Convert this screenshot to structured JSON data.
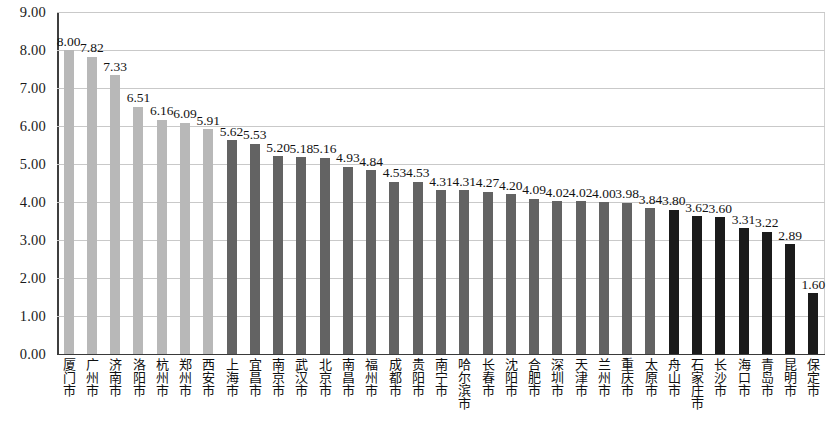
{
  "chart_data": {
    "type": "bar",
    "title": "",
    "subtitle": "",
    "xlabel": "",
    "ylabel": "",
    "ylim": [
      0.0,
      9.0
    ],
    "y_tick_step": 1.0,
    "grid": true,
    "legend": "none",
    "legend_position": "none",
    "y_ticks": [
      "0.00",
      "1.00",
      "2.00",
      "3.00",
      "4.00",
      "5.00",
      "6.00",
      "7.00",
      "8.00",
      "9.00"
    ],
    "categories": [
      "厦门市",
      "广州市",
      "济南市",
      "洛阳市",
      "杭州市",
      "郑州市",
      "西安市",
      "上海市",
      "宜昌市",
      "南京市",
      "武汉市",
      "北京市",
      "南昌市",
      "福州市",
      "成都市",
      "贵阳市",
      "南宁市",
      "哈尔滨市",
      "长春市",
      "沈阳市",
      "合肥市",
      "深圳市",
      "天津市",
      "兰州市",
      "重庆市",
      "太原市",
      "舟山市",
      "石家庄市",
      "长沙市",
      "海口市",
      "青岛市",
      "昆明市",
      "保定市"
    ],
    "values": [
      8.0,
      7.82,
      7.33,
      6.51,
      6.16,
      6.09,
      5.91,
      5.62,
      5.53,
      5.2,
      5.18,
      5.16,
      4.93,
      4.84,
      4.53,
      4.53,
      4.31,
      4.31,
      4.27,
      4.2,
      4.09,
      4.02,
      4.02,
      4.0,
      3.98,
      3.84,
      3.8,
      3.62,
      3.6,
      3.31,
      3.22,
      2.89,
      1.6
    ],
    "value_labels": [
      "8.00",
      "7.82",
      "7.33",
      "6.51",
      "6.16",
      "6.09",
      "5.91",
      "5.62",
      "5.53",
      "5.20",
      "5.18",
      "5.16",
      "4.93",
      "4.84",
      "4.53",
      "4.53",
      "4.31",
      "4.31",
      "4.27",
      "4.20",
      "4.09",
      "4.02",
      "4.02",
      "4.00",
      "3.98",
      "3.84",
      "3.80",
      "3.62",
      "3.60",
      "3.31",
      "3.22",
      "2.89",
      "1.60"
    ],
    "tones": [
      "light",
      "light",
      "light",
      "light",
      "light",
      "light",
      "light",
      "mid",
      "mid",
      "mid",
      "mid",
      "mid",
      "mid",
      "mid",
      "mid",
      "mid",
      "mid",
      "mid",
      "mid",
      "mid",
      "mid",
      "mid",
      "mid",
      "mid",
      "mid",
      "mid",
      "dark",
      "dark",
      "dark",
      "dark",
      "dark",
      "dark",
      "dark"
    ],
    "colors": {
      "tone_light": "#b8b8b8",
      "tone_mid": "#636363",
      "tone_dark": "#1b1b1b",
      "gridline": "#c9c9c9",
      "axis": "#3f3f3f",
      "text": "#121212",
      "background": "#ffffff"
    }
  }
}
